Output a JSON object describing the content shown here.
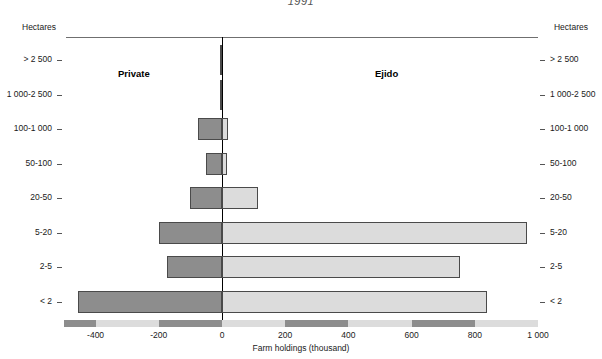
{
  "figure": {
    "year_caption": "1991",
    "left_header": "Hectares",
    "right_header": "Hectares",
    "left_series_label": "Private",
    "right_series_label": "Ejido",
    "axis_title": "Farm holdings (thousand)"
  },
  "colors": {
    "private_fill": "#8d8d8d",
    "ejido_fill": "#dcdcdc",
    "bar_outline": "#4a4a4a",
    "zero_line": "#000000",
    "rule": "#6f6f6f"
  },
  "chart_data": {
    "type": "bar",
    "orientation": "horizontal",
    "style": "diverging-population-pyramid",
    "title": "1991",
    "xlabel": "Farm holdings (thousand)",
    "ylabel": "Hectares",
    "xlim": [
      -500,
      1000
    ],
    "xticks": [
      -400,
      -200,
      0,
      200,
      400,
      600,
      800,
      1000
    ],
    "xticklabels": [
      "-400",
      "-200",
      "0",
      "200",
      "400",
      "600",
      "800",
      "1 000"
    ],
    "grid": false,
    "legend": "inline-labels",
    "categories": [
      "> 2 500",
      "1 000-2 500",
      "100-1 000",
      "50-100",
      "20-50",
      "5-20",
      "2-5",
      "< 2"
    ],
    "series": [
      {
        "name": "Private",
        "side": "left",
        "values": [
          3,
          5,
          76,
          52,
          101,
          199,
          174,
          456
        ]
      },
      {
        "name": "Ejido",
        "side": "right",
        "values": [
          0,
          0,
          19,
          17,
          114,
          965,
          753,
          838
        ]
      }
    ]
  },
  "ticks": [
    {
      "value": -400,
      "label": "-400"
    },
    {
      "value": -200,
      "label": "-200"
    },
    {
      "value": 0,
      "label": "0"
    },
    {
      "value": 200,
      "label": "200"
    },
    {
      "value": 400,
      "label": "400"
    },
    {
      "value": 600,
      "label": "600"
    },
    {
      "value": 800,
      "label": "800"
    },
    {
      "value": 1000,
      "label": "1 000"
    }
  ]
}
